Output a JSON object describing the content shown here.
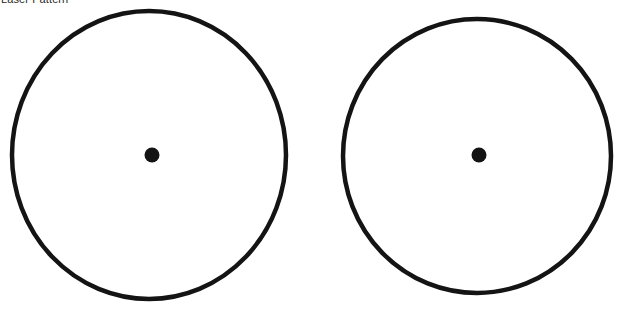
{
  "page": {
    "width": 629,
    "height": 309,
    "background_color": "#ffffff",
    "title": "Laser Pattern"
  },
  "style": {
    "stroke_color": "#141414",
    "dot_color": "#141414",
    "stroke_width": 4.5,
    "title_color": "#2a2a2a"
  },
  "figure": {
    "type": "two-circle-diagram",
    "shapes": [
      {
        "name": "left-circle",
        "kind": "ellipse",
        "cx": 149,
        "cy": 155,
        "rx": 137,
        "ry": 144,
        "fill": "none",
        "stroke": "#141414",
        "stroke_width": 4.5
      },
      {
        "name": "left-center-dot",
        "kind": "circle",
        "cx": 152,
        "cy": 155,
        "r": 7.5,
        "fill": "#141414"
      },
      {
        "name": "right-circle",
        "kind": "ellipse",
        "cx": 477,
        "cy": 156,
        "rx": 134,
        "ry": 137,
        "fill": "none",
        "stroke": "#141414",
        "stroke_width": 4.5
      },
      {
        "name": "right-center-dot",
        "kind": "circle",
        "cx": 479,
        "cy": 155,
        "r": 7.5,
        "fill": "#141414"
      }
    ]
  }
}
